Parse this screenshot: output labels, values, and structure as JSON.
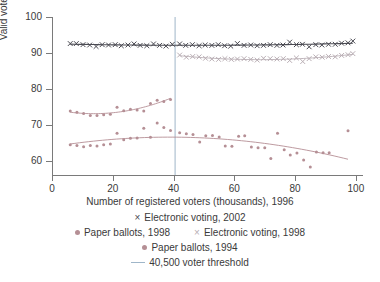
{
  "chart_data": {
    "type": "scatter",
    "title": "",
    "xlabel": "Number of registered voters (thousands), 1996",
    "ylabel": "Valid votes (%)",
    "xlim": [
      0,
      102
    ],
    "ylim": [
      56,
      100
    ],
    "xticks": [
      0,
      20,
      40,
      60,
      80,
      100
    ],
    "yticks": [
      60,
      70,
      80,
      90,
      100
    ],
    "grid": false,
    "legend_position": "below",
    "threshold": {
      "label": "40,500 voter threshold",
      "x": 40.5,
      "color": "#9fb6c9"
    },
    "series": [
      {
        "name": "Electronic voting, 2002",
        "marker": "x",
        "color": "#4a4a52",
        "points": [
          [
            6.0,
            92.6
          ],
          [
            8.0,
            92.6
          ],
          [
            10.2,
            92.3
          ],
          [
            12.4,
            92.2
          ],
          [
            14.5,
            91.8
          ],
          [
            16.5,
            92.3
          ],
          [
            18.6,
            92.2
          ],
          [
            20.8,
            92.3
          ],
          [
            22.8,
            92.0
          ],
          [
            25.0,
            92.2
          ],
          [
            27.0,
            92.5
          ],
          [
            29.0,
            92.1
          ],
          [
            31.2,
            92.0
          ],
          [
            33.4,
            92.5
          ],
          [
            35.4,
            92.1
          ],
          [
            37.5,
            91.9
          ],
          [
            39.6,
            92.4
          ],
          [
            42.0,
            92.5
          ],
          [
            44.0,
            92.1
          ],
          [
            46.2,
            92.3
          ],
          [
            48.4,
            92.0
          ],
          [
            50.4,
            92.2
          ],
          [
            52.6,
            92.1
          ],
          [
            54.7,
            92.3
          ],
          [
            56.8,
            92.0
          ],
          [
            58.8,
            91.9
          ],
          [
            61.0,
            92.6
          ],
          [
            63.2,
            92.1
          ],
          [
            65.4,
            92.2
          ],
          [
            67.5,
            92.0
          ],
          [
            69.6,
            92.1
          ],
          [
            71.8,
            92.3
          ],
          [
            74.0,
            92.1
          ],
          [
            76.0,
            92.2
          ],
          [
            78.2,
            93.0
          ],
          [
            80.4,
            92.3
          ],
          [
            82.4,
            92.4
          ],
          [
            84.6,
            91.7
          ],
          [
            86.8,
            92.3
          ],
          [
            88.8,
            92.2
          ],
          [
            91.0,
            92.4
          ],
          [
            93.2,
            92.4
          ],
          [
            95.3,
            92.7
          ],
          [
            97.4,
            92.8
          ],
          [
            99.0,
            93.3
          ]
        ],
        "fit_present": true
      },
      {
        "name": "Electronic voting, 1998",
        "marker": "x",
        "color": "#b9aeb4",
        "points": [
          [
            42.0,
            89.4
          ],
          [
            44.2,
            88.8
          ],
          [
            46.3,
            89.0
          ],
          [
            48.4,
            88.9
          ],
          [
            50.5,
            88.5
          ],
          [
            52.6,
            88.3
          ],
          [
            54.8,
            88.2
          ],
          [
            56.9,
            88.4
          ],
          [
            59.0,
            88.2
          ],
          [
            61.0,
            88.3
          ],
          [
            63.2,
            88.4
          ],
          [
            65.4,
            88.2
          ],
          [
            67.5,
            88.0
          ],
          [
            69.6,
            88.5
          ],
          [
            71.8,
            88.4
          ],
          [
            74.0,
            88.3
          ],
          [
            76.1,
            88.4
          ],
          [
            78.2,
            87.9
          ],
          [
            80.4,
            88.6
          ],
          [
            82.5,
            87.6
          ],
          [
            84.6,
            88.4
          ],
          [
            86.8,
            88.9
          ],
          [
            88.9,
            88.8
          ],
          [
            91.0,
            89.0
          ],
          [
            93.2,
            88.9
          ],
          [
            95.3,
            89.3
          ],
          [
            97.4,
            89.5
          ],
          [
            99.0,
            89.8
          ]
        ],
        "fit_present": true
      },
      {
        "name": "Paper ballots, 1998",
        "marker": "dot",
        "color": "#b58f95",
        "points": [
          [
            6.0,
            73.8
          ],
          [
            8.2,
            73.5
          ],
          [
            10.4,
            73.1
          ],
          [
            12.6,
            72.6
          ],
          [
            14.8,
            72.6
          ],
          [
            17.0,
            72.8
          ],
          [
            19.2,
            72.9
          ],
          [
            21.4,
            74.9
          ],
          [
            23.6,
            73.9
          ],
          [
            25.8,
            74.3
          ],
          [
            28.0,
            74.1
          ],
          [
            30.2,
            73.8
          ],
          [
            32.4,
            75.9
          ],
          [
            34.6,
            76.8
          ],
          [
            36.8,
            76.5
          ],
          [
            39.0,
            77.0
          ]
        ],
        "fit_present": true
      },
      {
        "name": "Paper ballots, 1994",
        "marker": "dot",
        "color": "#b58f95",
        "points": [
          [
            6.0,
            64.4
          ],
          [
            8.2,
            64.2
          ],
          [
            10.4,
            63.9
          ],
          [
            12.6,
            64.2
          ],
          [
            14.8,
            64.1
          ],
          [
            17.0,
            64.4
          ],
          [
            19.2,
            64.6
          ],
          [
            21.4,
            67.6
          ],
          [
            23.6,
            65.8
          ],
          [
            25.8,
            66.2
          ],
          [
            28.0,
            66.3
          ],
          [
            30.2,
            69.0
          ],
          [
            32.4,
            66.5
          ],
          [
            34.6,
            70.5
          ],
          [
            36.8,
            69.2
          ],
          [
            39.0,
            68.4
          ],
          [
            42.0,
            67.8
          ],
          [
            44.2,
            67.5
          ],
          [
            46.4,
            67.3
          ],
          [
            48.6,
            65.2
          ],
          [
            50.6,
            66.9
          ],
          [
            52.8,
            67.0
          ],
          [
            55.0,
            66.6
          ],
          [
            57.0,
            64.1
          ],
          [
            59.2,
            64.0
          ],
          [
            61.4,
            66.8
          ],
          [
            63.4,
            66.9
          ],
          [
            65.6,
            63.8
          ],
          [
            67.8,
            63.6
          ],
          [
            70.0,
            63.6
          ],
          [
            72.0,
            60.6
          ],
          [
            74.2,
            67.6
          ],
          [
            76.4,
            63.0
          ],
          [
            78.4,
            61.6
          ],
          [
            80.6,
            62.1
          ],
          [
            82.8,
            60.2
          ],
          [
            85.0,
            58.2
          ],
          [
            87.0,
            62.4
          ],
          [
            89.2,
            62.2
          ],
          [
            91.2,
            62.2
          ],
          [
            97.4,
            68.3
          ]
        ],
        "fit_present": true
      }
    ]
  },
  "legend": {
    "rows": [
      [
        {
          "marker": "x",
          "color": "#4a4a52",
          "label": "Electronic voting, 2002"
        }
      ],
      [
        {
          "marker": "dot",
          "color": "#b58f95",
          "label": "Paper ballots, 1998"
        },
        {
          "marker": "x",
          "color": "#b9aeb4",
          "label": "Electronic voting, 1998"
        }
      ],
      [
        {
          "marker": "dot",
          "color": "#b58f95",
          "label": "Paper ballots, 1994"
        }
      ],
      [
        {
          "marker": "line",
          "color": "#9fb6c9",
          "label": "40,500 voter threshold"
        }
      ]
    ]
  },
  "axes": {
    "ytick_labels": [
      "100",
      "90",
      "80",
      "70",
      "60"
    ],
    "xtick_labels": [
      "0",
      "20",
      "40",
      "60",
      "80",
      "100"
    ],
    "ylabel": "Valid votes (%)",
    "xlabel": "Number of registered voters (thousands), 1996"
  }
}
